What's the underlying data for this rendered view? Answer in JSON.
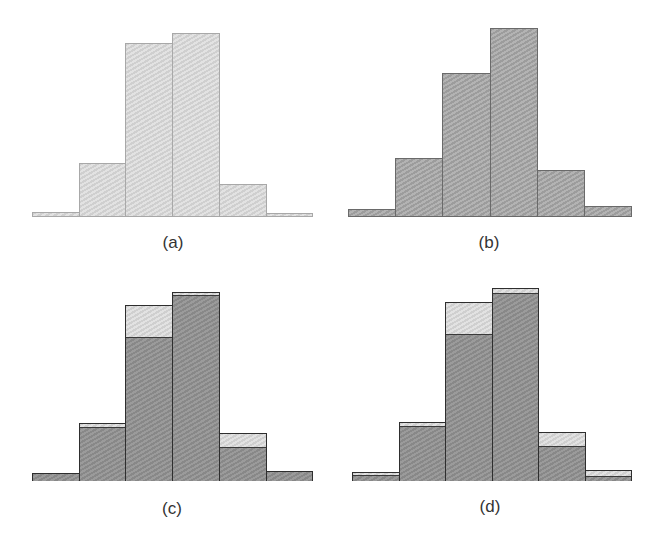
{
  "chart_data": [
    {
      "type": "bar",
      "title": "(a)",
      "categories": [
        "1",
        "2",
        "3",
        "4",
        "5",
        "6"
      ],
      "values": [
        5,
        54,
        174,
        184,
        33,
        4
      ],
      "style": "light-hatched",
      "xlabel": "",
      "ylabel": "",
      "grid": false
    },
    {
      "type": "bar",
      "title": "(b)",
      "categories": [
        "1",
        "2",
        "3",
        "4",
        "5",
        "6"
      ],
      "values": [
        8,
        59,
        144,
        189,
        47,
        11
      ],
      "style": "dark-hatched",
      "xlabel": "",
      "ylabel": "",
      "grid": false
    },
    {
      "type": "bar",
      "title": "(c)",
      "categories": [
        "1",
        "2",
        "3",
        "4",
        "5",
        "6"
      ],
      "series": [
        {
          "name": "light",
          "values": [
            8,
            58,
            176,
            189,
            48,
            10
          ]
        },
        {
          "name": "dark",
          "values": [
            8,
            54,
            144,
            186,
            34,
            10
          ]
        }
      ],
      "style": "overlaid",
      "xlabel": "",
      "ylabel": "",
      "grid": false
    },
    {
      "type": "bar",
      "title": "(d)",
      "categories": [
        "1",
        "2",
        "3",
        "4",
        "5",
        "6"
      ],
      "series": [
        {
          "name": "light",
          "values": [
            9,
            59,
            179,
            193,
            49,
            11
          ]
        },
        {
          "name": "dark",
          "values": [
            6,
            55,
            147,
            188,
            35,
            5
          ]
        }
      ],
      "style": "overlaid",
      "xlabel": "",
      "ylabel": "",
      "grid": false
    }
  ],
  "labels": {
    "a": "(a)",
    "b": "(b)",
    "c": "(c)",
    "d": "(d)"
  },
  "colors": {
    "light": "#d6d6d6",
    "dark": "#a6a6a6",
    "overlay": "#909090",
    "outline": "#2e2e2e"
  }
}
